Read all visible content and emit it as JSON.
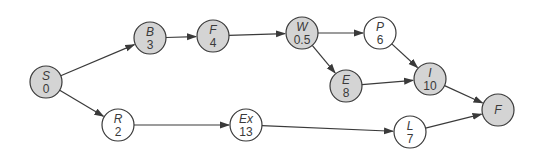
{
  "diagram": {
    "type": "activity-network",
    "colors": {
      "critical_fill": "#d4d4d4",
      "normal_fill": "#ffffff",
      "stroke": "#3a3a3a"
    },
    "node_radius": 16,
    "nodes": [
      {
        "id": "S",
        "name": "S",
        "value": "0",
        "x": 46,
        "y": 82,
        "critical": true
      },
      {
        "id": "B",
        "name": "B",
        "value": "3",
        "x": 150,
        "y": 38,
        "critical": true
      },
      {
        "id": "F1",
        "name": "F",
        "value": "4",
        "x": 213,
        "y": 36,
        "critical": true
      },
      {
        "id": "W",
        "name": "W",
        "value": "0.5",
        "x": 302,
        "y": 33,
        "critical": true
      },
      {
        "id": "P",
        "name": "P",
        "value": "6",
        "x": 380,
        "y": 33,
        "critical": false
      },
      {
        "id": "E",
        "name": "E",
        "value": "8",
        "x": 346,
        "y": 86,
        "critical": true
      },
      {
        "id": "I",
        "name": "I",
        "value": "10",
        "x": 430,
        "y": 79,
        "critical": true
      },
      {
        "id": "F2",
        "name": "F",
        "value": "",
        "x": 498,
        "y": 110,
        "critical": true
      },
      {
        "id": "R",
        "name": "R",
        "value": "2",
        "x": 118,
        "y": 125,
        "critical": false
      },
      {
        "id": "Ex",
        "name": "Ex",
        "value": "13",
        "x": 246,
        "y": 125,
        "critical": false
      },
      {
        "id": "L",
        "name": "L",
        "value": "7",
        "x": 410,
        "y": 132,
        "critical": false
      }
    ],
    "edges": [
      {
        "from": "S",
        "to": "B"
      },
      {
        "from": "B",
        "to": "F1"
      },
      {
        "from": "F1",
        "to": "W"
      },
      {
        "from": "W",
        "to": "P"
      },
      {
        "from": "W",
        "to": "E"
      },
      {
        "from": "P",
        "to": "I"
      },
      {
        "from": "E",
        "to": "I"
      },
      {
        "from": "I",
        "to": "F2"
      },
      {
        "from": "S",
        "to": "R"
      },
      {
        "from": "R",
        "to": "Ex"
      },
      {
        "from": "Ex",
        "to": "L"
      },
      {
        "from": "L",
        "to": "F2"
      }
    ]
  }
}
